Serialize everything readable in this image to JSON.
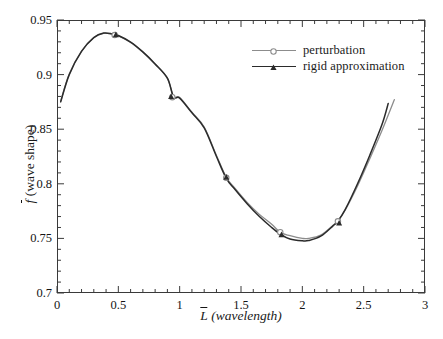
{
  "chart_data": {
    "type": "line",
    "title": "",
    "xlabel": "L (wavelength)",
    "ylabel": "f (wave shape)",
    "xlabel_symbol": "L",
    "xlabel_unit": "(wavelength)",
    "ylabel_symbol": "f",
    "ylabel_unit": "(wave shape)",
    "xlim": [
      0,
      3
    ],
    "ylim": [
      0.7,
      0.95
    ],
    "x_ticks": [
      0,
      0.5,
      1,
      1.5,
      2,
      2.5,
      3
    ],
    "x_tick_labels": [
      "0",
      "0.5",
      "1",
      "1.5",
      "2",
      "2.5",
      "3"
    ],
    "x_minor_step": 0.1,
    "y_ticks": [
      0.7,
      0.75,
      0.8,
      0.85,
      0.9,
      0.95
    ],
    "y_tick_labels": [
      "0.7",
      "0.75",
      "0.8",
      "0.85",
      "0.9",
      "0.95"
    ],
    "y_minor_step": 0.01,
    "grid": false,
    "legend_position": "upper right",
    "series": [
      {
        "name": "perturbation",
        "color": "#8c8c8c",
        "marker": "circle",
        "x": [
          0.03,
          0.1,
          0.2,
          0.3,
          0.38,
          0.45,
          0.5,
          0.6,
          0.7,
          0.8,
          0.9,
          0.95,
          1.0,
          1.1,
          1.2,
          1.3,
          1.38,
          1.45,
          1.55,
          1.65,
          1.75,
          1.82,
          1.9,
          2.0,
          2.05,
          2.15,
          2.25,
          2.29,
          2.35,
          2.45,
          2.55,
          2.65,
          2.75
        ],
        "y": [
          0.8755,
          0.9005,
          0.9215,
          0.934,
          0.9378,
          0.937,
          0.9355,
          0.9295,
          0.9205,
          0.9095,
          0.8965,
          0.88,
          0.879,
          0.8655,
          0.852,
          0.826,
          0.806,
          0.796,
          0.783,
          0.772,
          0.763,
          0.7555,
          0.7525,
          0.75,
          0.75,
          0.753,
          0.762,
          0.766,
          0.776,
          0.798,
          0.823,
          0.849,
          0.877
        ],
        "markers_x": [
          0.47,
          0.94,
          1.38,
          1.82,
          2.29
        ],
        "markers_y": [
          0.9362,
          0.8793,
          0.8055,
          0.7557,
          0.7656
        ]
      },
      {
        "name": "rigid approximation",
        "color": "#2b2b2b",
        "marker": "triangle",
        "x": [
          0.03,
          0.1,
          0.2,
          0.3,
          0.38,
          0.45,
          0.5,
          0.6,
          0.7,
          0.8,
          0.9,
          0.95,
          1.0,
          1.1,
          1.2,
          1.3,
          1.38,
          1.45,
          1.55,
          1.65,
          1.75,
          1.82,
          1.9,
          2.0,
          2.05,
          2.15,
          2.25,
          2.29,
          2.35,
          2.45,
          2.55,
          2.65,
          2.7
        ],
        "y": [
          0.875,
          0.9,
          0.9212,
          0.9338,
          0.938,
          0.9372,
          0.9358,
          0.9298,
          0.9208,
          0.9098,
          0.8968,
          0.8795,
          0.8785,
          0.865,
          0.8512,
          0.825,
          0.805,
          0.795,
          0.7818,
          0.77,
          0.76,
          0.754,
          0.7495,
          0.7478,
          0.748,
          0.752,
          0.7615,
          0.7658,
          0.7765,
          0.8,
          0.8262,
          0.8545,
          0.8735
        ],
        "markers_x": [
          0.48,
          0.93,
          1.38,
          1.83,
          2.3
        ],
        "markers_y": [
          0.9365,
          0.8798,
          0.806,
          0.7533,
          0.764
        ]
      }
    ]
  },
  "legend": {
    "items": [
      {
        "label": "perturbation",
        "color": "#8c8c8c",
        "marker": "circle"
      },
      {
        "label": "rigid approximation",
        "color": "#2b2b2b",
        "marker": "triangle"
      }
    ]
  }
}
